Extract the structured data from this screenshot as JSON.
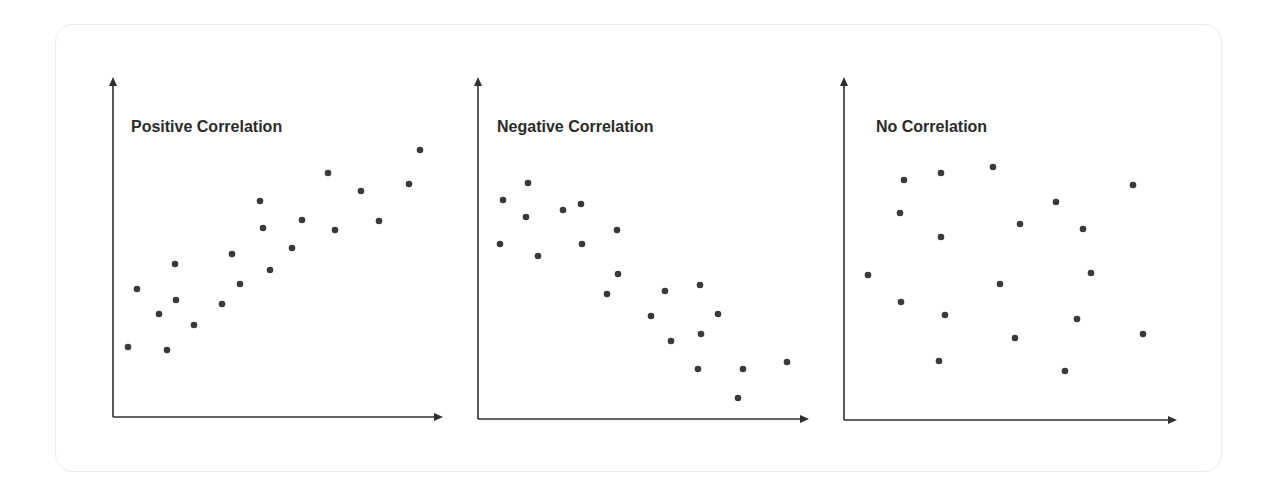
{
  "colors": {
    "axis": "#2f2f2f",
    "dot": "#3a3a3a",
    "title": "#2b2b2b",
    "card_border": "#ececec"
  },
  "chart_data": [
    {
      "type": "scatter",
      "title": "Positive Correlation",
      "xlabel": "",
      "ylabel": "",
      "grid": false,
      "axes_px": {
        "origin": [
          113,
          417
        ],
        "x_end": 443,
        "y_top": 77
      },
      "points_px": [
        [
          128,
          347
        ],
        [
          137,
          289
        ],
        [
          159,
          314
        ],
        [
          167,
          350
        ],
        [
          175,
          264
        ],
        [
          176,
          300
        ],
        [
          194,
          325
        ],
        [
          222,
          304
        ],
        [
          232,
          254
        ],
        [
          240,
          284
        ],
        [
          260,
          201
        ],
        [
          263,
          228
        ],
        [
          270,
          270
        ],
        [
          292,
          248
        ],
        [
          302,
          220
        ],
        [
          328,
          173
        ],
        [
          335,
          230
        ],
        [
          361,
          191
        ],
        [
          379,
          221
        ],
        [
          409,
          184
        ],
        [
          420,
          150
        ]
      ]
    },
    {
      "type": "scatter",
      "title": "Negative Correlation",
      "xlabel": "",
      "ylabel": "",
      "grid": false,
      "axes_px": {
        "origin": [
          478,
          419
        ],
        "x_end": 809,
        "y_top": 77
      },
      "points_px": [
        [
          500,
          244
        ],
        [
          503,
          200
        ],
        [
          526,
          217
        ],
        [
          528,
          183
        ],
        [
          538,
          256
        ],
        [
          563,
          210
        ],
        [
          581,
          204
        ],
        [
          582,
          244
        ],
        [
          607,
          294
        ],
        [
          617,
          230
        ],
        [
          618,
          274
        ],
        [
          651,
          316
        ],
        [
          665,
          291
        ],
        [
          671,
          341
        ],
        [
          698,
          369
        ],
        [
          700,
          285
        ],
        [
          701,
          334
        ],
        [
          718,
          314
        ],
        [
          738,
          398
        ],
        [
          743,
          369
        ],
        [
          787,
          362
        ]
      ]
    },
    {
      "type": "scatter",
      "title": "No Correlation",
      "xlabel": "",
      "ylabel": "",
      "grid": false,
      "axes_px": {
        "origin": [
          844,
          420
        ],
        "x_end": 1177,
        "y_top": 77
      },
      "points_px": [
        [
          868,
          275
        ],
        [
          900,
          213
        ],
        [
          901,
          302
        ],
        [
          904,
          180
        ],
        [
          939,
          361
        ],
        [
          941,
          173
        ],
        [
          941,
          237
        ],
        [
          945,
          315
        ],
        [
          993,
          167
        ],
        [
          1000,
          284
        ],
        [
          1015,
          338
        ],
        [
          1020,
          224
        ],
        [
          1056,
          202
        ],
        [
          1065,
          371
        ],
        [
          1077,
          319
        ],
        [
          1083,
          229
        ],
        [
          1091,
          273
        ],
        [
          1133,
          185
        ],
        [
          1143,
          334
        ]
      ]
    }
  ],
  "titles": [
    "Positive Correlation",
    "Negative Correlation",
    "No Correlation"
  ]
}
